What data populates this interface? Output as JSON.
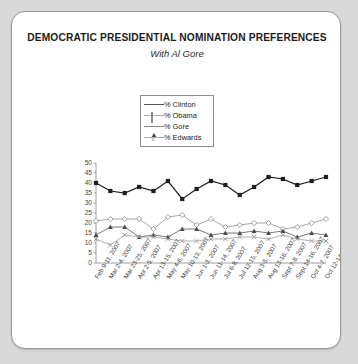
{
  "card": {
    "title": "DEMOCRATIC PRESIDENTIAL NOMINATION PREFERENCES",
    "subtitle": "With Al Gore"
  },
  "legend": {
    "position": "inside-top-center",
    "items": [
      {
        "label": "% Clinton",
        "marker": "filled-square-marker",
        "color": "#1f1f1f"
      },
      {
        "label": "% Obama",
        "marker": "open-diamond-marker",
        "color": "#8a8a8a"
      },
      {
        "label": "% Gore",
        "marker": "filled-triangle-marker",
        "color": "#4a4a4a"
      },
      {
        "label": "% Edwards",
        "marker": "cross-x-marker",
        "color": "#999999"
      }
    ]
  },
  "chart_data": {
    "type": "line",
    "title": "DEMOCRATIC PRESIDENTIAL NOMINATION PREFERENCES",
    "subtitle": "With Al Gore",
    "xlabel": "",
    "ylabel": "",
    "ylim": [
      0,
      50
    ],
    "yticks": [
      0,
      5,
      10,
      15,
      20,
      25,
      30,
      35,
      40,
      45,
      50
    ],
    "grid": false,
    "legend_position": "inside-top-center",
    "categories": [
      "Feb 9-11, 2007",
      "Mar 2-4, 2007",
      "Mar 23-25, 2007",
      "Apr 2-5, 2007",
      "Apr 13-15, 2007",
      "May 4-6, 2007",
      "May 10-13, 2007",
      "Jun 1-3, 2007",
      "Jun 11-14, 2007",
      "Jul 6-8, 2007",
      "Jul 12-15, 2007",
      "Aug 3-5, 2007",
      "Aug 13-16, 2007",
      "Sept 7-8, 2007",
      "Sept 14-16, 2007",
      "Oct 4-7, 2007",
      "Oct 12-14, 2007"
    ],
    "series": [
      {
        "name": "% Clinton",
        "marker": "filled-square-marker",
        "color": "#1f1f1f",
        "values": [
          40,
          36,
          35,
          38,
          36,
          41,
          32,
          37,
          41,
          39,
          34,
          38,
          43,
          42,
          39,
          41,
          43
        ]
      },
      {
        "name": "% Obama",
        "marker": "open-diamond-marker",
        "color": "#8a8a8a",
        "values": [
          21,
          22,
          22,
          22,
          17,
          23,
          24,
          19,
          22,
          18,
          19,
          20,
          20,
          17,
          18,
          20,
          22
        ]
      },
      {
        "name": "% Gore",
        "marker": "filled-triangle-marker",
        "color": "#4a4a4a",
        "values": [
          14,
          18,
          18,
          13,
          14,
          13,
          17,
          17,
          14,
          15,
          15,
          16,
          15,
          16,
          13,
          15,
          14
        ]
      },
      {
        "name": "% Edwards",
        "marker": "cross-x-marker",
        "color": "#999999",
        "values": [
          12,
          9,
          14,
          13,
          13,
          12,
          11,
          11,
          12,
          12,
          13,
          13,
          12,
          14,
          12,
          11,
          11
        ]
      }
    ]
  }
}
